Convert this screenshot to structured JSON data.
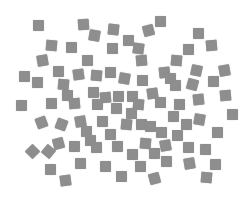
{
  "scene": {
    "description": "Scattered gray squares on a white background",
    "background_color": "#ffffff",
    "square_color": "#8e8e8e",
    "square_size_px": 11,
    "count": 92,
    "squares": [
      {
        "x": 38,
        "y": 25,
        "r": 0
      },
      {
        "x": 83,
        "y": 24,
        "r": -4
      },
      {
        "x": 113,
        "y": 29,
        "r": 6
      },
      {
        "x": 160,
        "y": 21,
        "r": 0
      },
      {
        "x": 148,
        "y": 30,
        "r": -15
      },
      {
        "x": 94,
        "y": 35,
        "r": 10
      },
      {
        "x": 198,
        "y": 33,
        "r": 0
      },
      {
        "x": 51,
        "y": 45,
        "r": 5
      },
      {
        "x": 71,
        "y": 47,
        "r": 0
      },
      {
        "x": 112,
        "y": 48,
        "r": 0
      },
      {
        "x": 138,
        "y": 48,
        "r": 8
      },
      {
        "x": 188,
        "y": 49,
        "r": 0
      },
      {
        "x": 211,
        "y": 45,
        "r": -5
      },
      {
        "x": 42,
        "y": 60,
        "r": -10
      },
      {
        "x": 87,
        "y": 60,
        "r": 0
      },
      {
        "x": 141,
        "y": 60,
        "r": -5
      },
      {
        "x": 58,
        "y": 71,
        "r": 0
      },
      {
        "x": 78,
        "y": 74,
        "r": -8
      },
      {
        "x": 96,
        "y": 75,
        "r": 5
      },
      {
        "x": 110,
        "y": 72,
        "r": 0
      },
      {
        "x": 124,
        "y": 78,
        "r": 10
      },
      {
        "x": 142,
        "y": 80,
        "r": 0
      },
      {
        "x": 164,
        "y": 72,
        "r": -6
      },
      {
        "x": 170,
        "y": 78,
        "r": 0
      },
      {
        "x": 196,
        "y": 70,
        "r": 12
      },
      {
        "x": 224,
        "y": 70,
        "r": -10
      },
      {
        "x": 37,
        "y": 82,
        "r": 0
      },
      {
        "x": 63,
        "y": 84,
        "r": 5
      },
      {
        "x": 93,
        "y": 92,
        "r": 0
      },
      {
        "x": 105,
        "y": 97,
        "r": -5
      },
      {
        "x": 118,
        "y": 96,
        "r": 0
      },
      {
        "x": 132,
        "y": 96,
        "r": 0
      },
      {
        "x": 152,
        "y": 93,
        "r": -8
      },
      {
        "x": 175,
        "y": 85,
        "r": 0
      },
      {
        "x": 192,
        "y": 84,
        "r": 15
      },
      {
        "x": 213,
        "y": 81,
        "r": 0
      },
      {
        "x": 21,
        "y": 105,
        "r": 0
      },
      {
        "x": 51,
        "y": 103,
        "r": 0
      },
      {
        "x": 74,
        "y": 103,
        "r": -5
      },
      {
        "x": 97,
        "y": 104,
        "r": 0
      },
      {
        "x": 116,
        "y": 108,
        "r": 0
      },
      {
        "x": 138,
        "y": 104,
        "r": 5
      },
      {
        "x": 160,
        "y": 102,
        "r": 0
      },
      {
        "x": 179,
        "y": 104,
        "r": 0
      },
      {
        "x": 198,
        "y": 99,
        "r": -6
      },
      {
        "x": 232,
        "y": 114,
        "r": 0
      },
      {
        "x": 41,
        "y": 122,
        "r": -20
      },
      {
        "x": 61,
        "y": 124,
        "r": 20
      },
      {
        "x": 80,
        "y": 121,
        "r": -10
      },
      {
        "x": 102,
        "y": 121,
        "r": 0
      },
      {
        "x": 126,
        "y": 124,
        "r": 5
      },
      {
        "x": 141,
        "y": 124,
        "r": 0
      },
      {
        "x": 150,
        "y": 126,
        "r": 0
      },
      {
        "x": 173,
        "y": 116,
        "r": 0
      },
      {
        "x": 186,
        "y": 124,
        "r": 0
      },
      {
        "x": 199,
        "y": 119,
        "r": 10
      },
      {
        "x": 217,
        "y": 132,
        "r": 0
      },
      {
        "x": 32,
        "y": 151,
        "r": 45
      },
      {
        "x": 48,
        "y": 151,
        "r": 40
      },
      {
        "x": 58,
        "y": 143,
        "r": -15
      },
      {
        "x": 74,
        "y": 146,
        "r": 0
      },
      {
        "x": 90,
        "y": 140,
        "r": 0
      },
      {
        "x": 96,
        "y": 147,
        "r": 0
      },
      {
        "x": 117,
        "y": 146,
        "r": 0
      },
      {
        "x": 145,
        "y": 143,
        "r": 5
      },
      {
        "x": 154,
        "y": 153,
        "r": 0
      },
      {
        "x": 165,
        "y": 145,
        "r": -10
      },
      {
        "x": 188,
        "y": 147,
        "r": 0
      },
      {
        "x": 205,
        "y": 149,
        "r": 0
      },
      {
        "x": 50,
        "y": 169,
        "r": 0
      },
      {
        "x": 105,
        "y": 166,
        "r": 0
      },
      {
        "x": 132,
        "y": 154,
        "r": 0
      },
      {
        "x": 166,
        "y": 161,
        "r": 0
      },
      {
        "x": 189,
        "y": 163,
        "r": -10
      },
      {
        "x": 215,
        "y": 164,
        "r": 0
      },
      {
        "x": 65,
        "y": 180,
        "r": -8
      },
      {
        "x": 121,
        "y": 176,
        "r": 0
      },
      {
        "x": 154,
        "y": 178,
        "r": -15
      },
      {
        "x": 206,
        "y": 177,
        "r": 5
      },
      {
        "x": 128,
        "y": 40,
        "r": 0
      },
      {
        "x": 176,
        "y": 60,
        "r": 5
      },
      {
        "x": 67,
        "y": 95,
        "r": 0
      },
      {
        "x": 86,
        "y": 131,
        "r": 0
      },
      {
        "x": 110,
        "y": 134,
        "r": 0
      },
      {
        "x": 131,
        "y": 113,
        "r": 0
      },
      {
        "x": 161,
        "y": 132,
        "r": 0
      },
      {
        "x": 177,
        "y": 135,
        "r": 0
      },
      {
        "x": 80,
        "y": 163,
        "r": 0
      },
      {
        "x": 140,
        "y": 166,
        "r": 0
      },
      {
        "x": 225,
        "y": 95,
        "r": -5
      },
      {
        "x": 24,
        "y": 76,
        "r": 0
      }
    ]
  }
}
